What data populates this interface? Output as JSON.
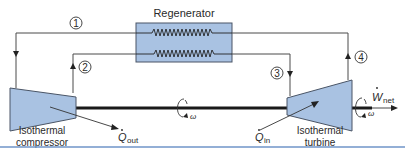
{
  "regenerator": {
    "label": "Regenerator"
  },
  "states": [
    {
      "id": "1",
      "label": "1"
    },
    {
      "id": "2",
      "label": "2"
    },
    {
      "id": "3",
      "label": "3"
    },
    {
      "id": "4",
      "label": "4"
    }
  ],
  "compressor": {
    "line1": "Isothermal",
    "line2": "compressor"
  },
  "turbine": {
    "line1": "Isothermal",
    "line2": "turbine"
  },
  "heat_out": {
    "symbol": "Q",
    "subscript": "out"
  },
  "heat_in": {
    "symbol": "Q",
    "subscript": "in"
  },
  "work": {
    "symbol": "W",
    "subscript": "net"
  },
  "shaft_speed": {
    "symbol": "ω"
  },
  "colors": {
    "component_fill": "#a9c2e2",
    "component_stroke": "#4a5566",
    "line": "#4a4a4a",
    "rule": "#6f95c8"
  }
}
